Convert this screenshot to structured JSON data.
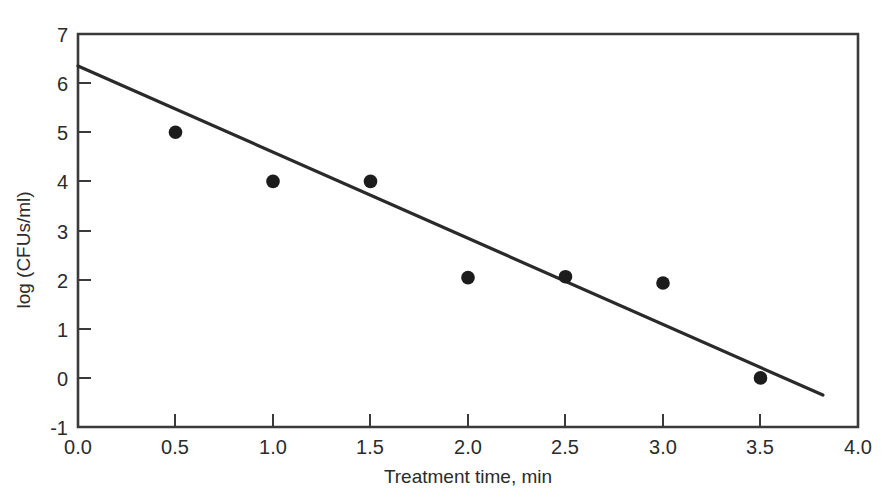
{
  "chart_data": {
    "type": "scatter",
    "title": "",
    "subtitle": "",
    "xlabel": "Treatment time, min",
    "ylabel": "log (CFUs/ml)",
    "xlim": [
      0.0,
      4.0
    ],
    "ylim": [
      -1,
      7
    ],
    "grid": false,
    "legend": null,
    "xticks": [
      0.0,
      0.5,
      1.0,
      1.5,
      2.0,
      2.5,
      3.0,
      3.5,
      4.0
    ],
    "xtick_labels": [
      "0.0",
      "0.5",
      "1.0",
      "1.5",
      "2.0",
      "2.5",
      "3.0",
      "3.5",
      "4.0"
    ],
    "yticks": [
      -1,
      0,
      1,
      2,
      3,
      4,
      5,
      6,
      7
    ],
    "ytick_labels": [
      "-1",
      "0",
      "1",
      "2",
      "3",
      "4",
      "5",
      "6",
      "7"
    ],
    "series": [
      {
        "name": "observed",
        "type": "scatter",
        "marker": "filled-circle",
        "color": "#1c1c1c",
        "points": [
          {
            "x": 0.5,
            "y": 5.0
          },
          {
            "x": 1.0,
            "y": 4.0
          },
          {
            "x": 1.5,
            "y": 4.0
          },
          {
            "x": 2.0,
            "y": 2.04
          },
          {
            "x": 2.5,
            "y": 2.06
          },
          {
            "x": 3.0,
            "y": 1.93
          },
          {
            "x": 3.5,
            "y": 0.0
          }
        ]
      },
      {
        "name": "regression-line",
        "type": "line",
        "color": "#2a2a2a",
        "endpoints": [
          {
            "x": 0.0,
            "y": 6.35
          },
          {
            "x": 3.82,
            "y": -0.35
          }
        ],
        "slope": -1.754,
        "intercept": 6.35
      }
    ],
    "annotations": []
  },
  "axes": {
    "x_title": "Treatment time, min",
    "y_title": "log (CFUs/ml)"
  },
  "colors": {
    "frame": "#3a3a3a",
    "marker": "#1c1c1c",
    "line": "#2a2a2a",
    "text": "#2b2b2b",
    "background": "#ffffff"
  }
}
